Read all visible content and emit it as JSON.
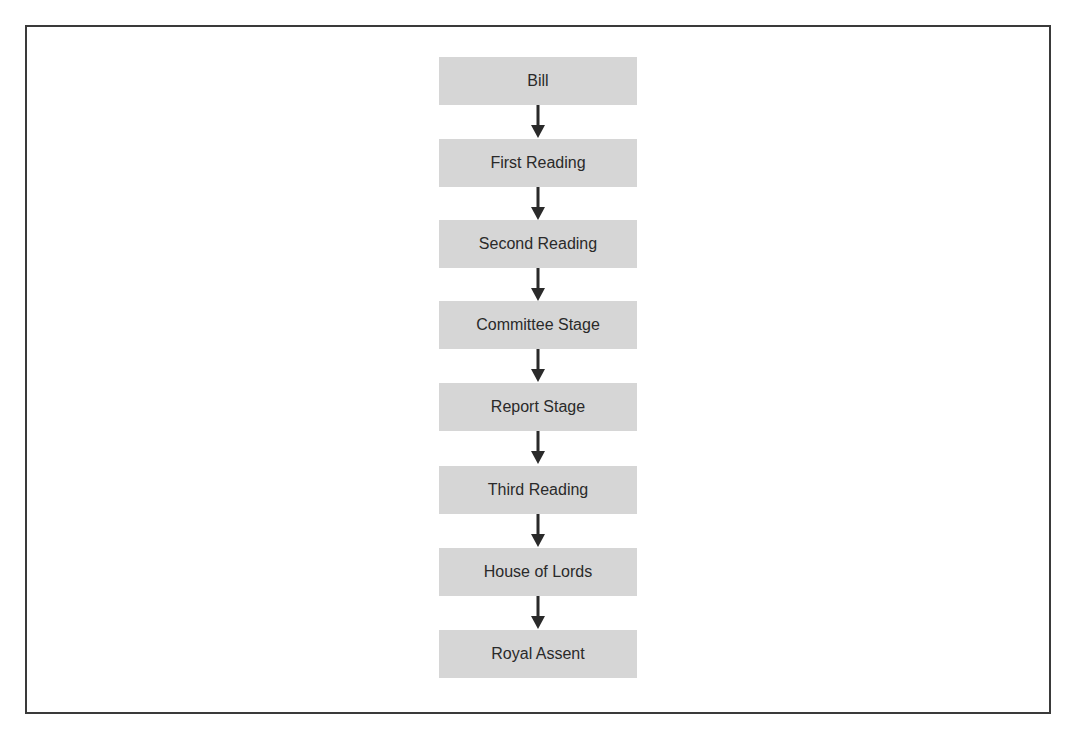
{
  "diagram": {
    "type": "flowchart",
    "direction": "top-to-bottom",
    "steps": [
      {
        "label": "Bill"
      },
      {
        "label": "First Reading"
      },
      {
        "label": "Second Reading"
      },
      {
        "label": "Committee Stage"
      },
      {
        "label": "Report Stage"
      },
      {
        "label": "Third Reading"
      },
      {
        "label": "House of Lords"
      },
      {
        "label": "Royal Assent"
      }
    ],
    "colors": {
      "box_fill": "#d6d6d6",
      "text": "#2a2a2a",
      "arrow": "#2a2a2a",
      "frame": "#3a3a3a"
    }
  }
}
